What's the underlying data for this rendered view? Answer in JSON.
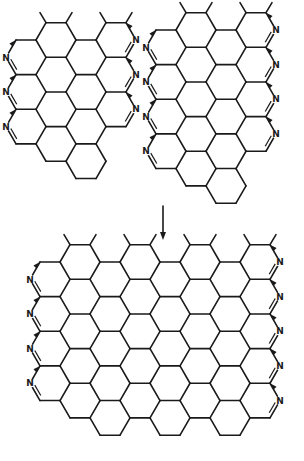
{
  "figure": {
    "colors": {
      "ink": "#1a1a1a",
      "background": "#ffffff"
    },
    "atom_symbol": "N"
  },
  "structures": [
    {
      "id": "left-fragment",
      "origin": [
        56,
        40
      ],
      "cols": 2,
      "rows": 4,
      "edge": 20,
      "left_N_rows": [
        0,
        1,
        2
      ],
      "right_N_rows": [
        0,
        1,
        2
      ]
    },
    {
      "id": "right-fragment",
      "origin": [
        196,
        30
      ],
      "cols": 2,
      "rows": 5,
      "edge": 20,
      "left_N_rows": [
        0,
        1,
        2,
        3
      ],
      "right_N_rows": [
        0,
        1,
        2,
        3
      ]
    },
    {
      "id": "fused-product",
      "origin": [
        80,
        262
      ],
      "cols": 6,
      "rows": 5,
      "edge": 20,
      "left_N_rows": [
        0,
        1,
        2,
        3
      ],
      "right_N_rows": [
        0,
        1,
        2,
        3,
        4
      ]
    }
  ],
  "arrow": {
    "x": 163,
    "y1": 206,
    "y2": 240,
    "label": ""
  }
}
